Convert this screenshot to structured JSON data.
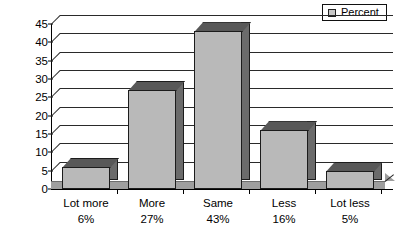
{
  "legend": {
    "marker_name": "legend-square-marker",
    "label": "Percent",
    "position": "top-right"
  },
  "chart_data": {
    "type": "bar",
    "title": "",
    "subtitle": "",
    "xlabel": "",
    "ylabel": "",
    "categories": [
      "Lot more",
      "More",
      "Same",
      "Less",
      "Lot less"
    ],
    "values": [
      6,
      27,
      43,
      16,
      5
    ],
    "value_labels": [
      "6%",
      "27%",
      "43%",
      "16%",
      "5%"
    ],
    "series": [
      {
        "name": "Percent",
        "values": [
          6,
          27,
          43,
          16,
          5
        ]
      }
    ],
    "ylim": [
      0,
      45
    ],
    "yticks": [
      0,
      5,
      10,
      15,
      20,
      25,
      30,
      35,
      40,
      45
    ],
    "ytick_labels": [
      "0",
      "5",
      "10",
      "15",
      "20",
      "25",
      "30",
      "35",
      "40",
      "45"
    ],
    "grid": true,
    "grid_axis": "y",
    "legend": [
      "Percent"
    ],
    "legend_position": "upper right",
    "style": "3d-bar",
    "colors": {
      "bar_front": "#b9b9b9",
      "bar_side": "#6b6b6b",
      "bar_top": "#585858",
      "outline": "#1c1c1c",
      "grid": "#2a2a2a",
      "floor": "#9e9e9e",
      "background": "#ffffff",
      "text": "#000000"
    }
  }
}
